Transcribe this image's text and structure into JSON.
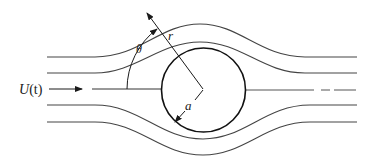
{
  "diagram": {
    "labels": {
      "freestream": "U(t)",
      "freestream_U": "U",
      "freestream_t": "(t)",
      "radius_coord": "r",
      "angle_coord": "θ",
      "cylinder_radius": "a"
    },
    "colors": {
      "stroke": "#1a1a1a",
      "streamline": "#444444",
      "background": "#ffffff"
    },
    "geometry": {
      "cylinder_center": [
        203,
        90
      ],
      "cylinder_radius_px": 42,
      "theta_arc_radius_px": 76
    },
    "streamlines": [
      {
        "name": "upper-outer",
        "far_y": 57,
        "peak_y": 24
      },
      {
        "name": "upper-inner",
        "far_y": 73,
        "peak_y": 42
      },
      {
        "name": "lower-inner",
        "far_y": 105,
        "trough_y": 139
      },
      {
        "name": "lower-outer",
        "far_y": 122,
        "trough_y": 155
      }
    ]
  }
}
